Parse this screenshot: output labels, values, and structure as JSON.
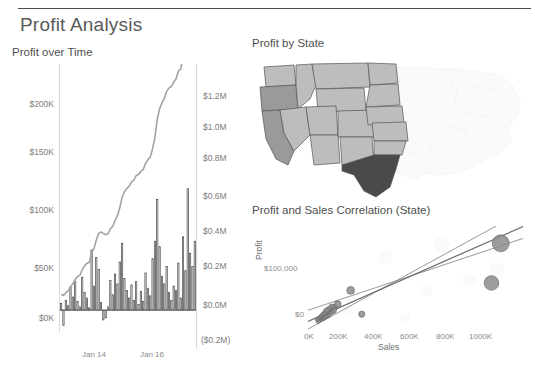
{
  "dashboard": {
    "title": "Profit Analysis"
  },
  "panels": {
    "profit_over_time": {
      "title": "Profit over Time",
      "y_left_ticks": [
        "$200K",
        "$150K",
        "$100K",
        "$50K",
        "$0K"
      ],
      "y_right_ticks": [
        "$1.2M",
        "$1.0M",
        "$0.8M",
        "$0.6M",
        "$0.4M",
        "$0.2M",
        "$0.0M",
        "($0.2M)"
      ],
      "x_ticks": [
        "Jan 14",
        "Jan 16"
      ]
    },
    "profit_by_state": {
      "title": "Profit by State"
    },
    "correlation": {
      "title": "Profit and Sales Correlation (State)",
      "y_label": "Profit",
      "x_label": "Sales",
      "y_ticks": [
        "$100,000",
        "$0"
      ],
      "x_ticks": [
        "0K",
        "200K",
        "400K",
        "600K",
        "800K",
        "1000K"
      ]
    }
  },
  "colors": {
    "bar_stroke": "#3f3f3f",
    "bar_fill": "#ffffff",
    "line": "#9e9e9e",
    "map_dark": "#4a4a4a",
    "map_mid": "#9a9a9a",
    "map_light": "#bdbdbd",
    "map_faint": "#f4f4f4",
    "scatter_mark": "#8c8c8c",
    "trend_line": "#6b6b6b"
  },
  "chart_data": [
    {
      "type": "bar",
      "title": "Profit over Time",
      "xlabel": "",
      "ylabel": "Profit",
      "ylim": [
        -20000,
        225000
      ],
      "y2lim": [
        -200000,
        1300000
      ],
      "grid": false,
      "x_tick_labels": [
        "Jan 14",
        "Jan 16"
      ],
      "x_tick_positions": [
        0.24,
        0.62
      ],
      "series": [
        {
          "name": "Monthly Profit",
          "type": "bar",
          "values": [
            6000,
            -14000,
            9000,
            4000,
            21000,
            12000,
            26000,
            8000,
            3000,
            30000,
            16000,
            11000,
            2000,
            55000,
            22000,
            48000,
            37000,
            7000,
            -9000,
            -7000,
            3000,
            27000,
            14000,
            33000,
            24000,
            44000,
            61000,
            29000,
            18000,
            11000,
            23000,
            9000,
            26000,
            5000,
            17000,
            8000,
            34000,
            20000,
            13000,
            47000,
            63000,
            101000,
            58000,
            31000,
            24000,
            40000,
            16000,
            9000,
            22000,
            18000,
            43000,
            11000,
            67000,
            36000,
            111000,
            52000,
            40000,
            63000
          ]
        },
        {
          "name": "Running Total of Profit",
          "type": "line",
          "axis": "right",
          "values": [
            10000,
            5000,
            20000,
            30000,
            55000,
            70000,
            95000,
            110000,
            118000,
            150000,
            170000,
            185000,
            190000,
            245000,
            268000,
            315000,
            352000,
            360000,
            352000,
            345000,
            350000,
            378000,
            392000,
            425000,
            450000,
            495000,
            556000,
            585000,
            604000,
            616000,
            640000,
            650000,
            676000,
            682000,
            700000,
            709000,
            744000,
            765000,
            779000,
            827000,
            890000,
            992000,
            1050000,
            1082000,
            1107000,
            1148000,
            1165000,
            1175000,
            1198000,
            1217000,
            1261000,
            1273000,
            1341000,
            1378000,
            1490000,
            1543000,
            1584000,
            1648000
          ]
        }
      ]
    },
    {
      "type": "map",
      "title": "Profit by State",
      "region": "United States (western states highlighted)",
      "encoding": "grayscale shading by profit",
      "states": [
        {
          "name": "Texas",
          "shade": "dark"
        },
        {
          "name": "California",
          "shade": "mid"
        },
        {
          "name": "Oregon",
          "shade": "mid"
        },
        {
          "name": "Washington",
          "shade": "light"
        },
        {
          "name": "Idaho",
          "shade": "light"
        },
        {
          "name": "Nevada",
          "shade": "light"
        },
        {
          "name": "Montana",
          "shade": "light"
        },
        {
          "name": "Wyoming",
          "shade": "light"
        },
        {
          "name": "Utah",
          "shade": "light"
        },
        {
          "name": "Colorado",
          "shade": "light"
        },
        {
          "name": "Arizona",
          "shade": "light"
        },
        {
          "name": "New Mexico",
          "shade": "light"
        },
        {
          "name": "North Dakota",
          "shade": "light"
        },
        {
          "name": "South Dakota",
          "shade": "light"
        },
        {
          "name": "Nebraska",
          "shade": "light"
        },
        {
          "name": "Kansas",
          "shade": "light"
        },
        {
          "name": "Oklahoma",
          "shade": "light"
        }
      ]
    },
    {
      "type": "scatter",
      "title": "Profit and Sales Correlation (State)",
      "xlabel": "Sales",
      "ylabel": "Profit",
      "xlim": [
        -40000,
        1120000
      ],
      "ylim": [
        -20000,
        190000
      ],
      "x_ticks": [
        0,
        200000,
        400000,
        600000,
        800000,
        1000000
      ],
      "y_ticks": [
        0,
        100000
      ],
      "grid": false,
      "trend_lines": 3,
      "points": [
        {
          "x": 1000000,
          "y": 155000,
          "size": 22
        },
        {
          "x": 950000,
          "y": 75000,
          "size": 19
        },
        {
          "x": 190000,
          "y": 60000,
          "size": 10
        },
        {
          "x": 250000,
          "y": 12000,
          "size": 8
        },
        {
          "x": 120000,
          "y": 32000,
          "size": 9
        },
        {
          "x": 100000,
          "y": 25000,
          "size": 8
        },
        {
          "x": 95000,
          "y": 20000,
          "size": 9
        },
        {
          "x": 88000,
          "y": 27000,
          "size": 7
        },
        {
          "x": 80000,
          "y": 16000,
          "size": 8
        },
        {
          "x": 72000,
          "y": 22000,
          "size": 7
        },
        {
          "x": 68000,
          "y": 10000,
          "size": 7
        },
        {
          "x": 60000,
          "y": 18000,
          "size": 8
        },
        {
          "x": 55000,
          "y": 8000,
          "size": 7
        },
        {
          "x": 50000,
          "y": 14000,
          "size": 6
        },
        {
          "x": 45000,
          "y": 5000,
          "size": 7
        },
        {
          "x": 40000,
          "y": 11000,
          "size": 6
        },
        {
          "x": 35000,
          "y": 3000,
          "size": 6
        },
        {
          "x": 30000,
          "y": 7000,
          "size": 6
        },
        {
          "x": 25000,
          "y": 1000,
          "size": 6
        },
        {
          "x": 20000,
          "y": 4000,
          "size": 5
        },
        {
          "x": 15000,
          "y": -2000,
          "size": 6
        },
        {
          "x": 10000,
          "y": 2000,
          "size": 5
        }
      ]
    }
  ]
}
